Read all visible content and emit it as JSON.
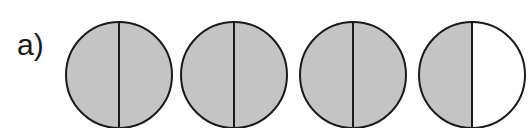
{
  "label": "a)",
  "colors": {
    "shaded": "#c4c4c4",
    "unshaded": "#ffffff",
    "stroke": "#1a1a1a"
  },
  "circles": [
    {
      "cx": 119,
      "left_shaded": true,
      "right_shaded": true
    },
    {
      "cx": 234,
      "left_shaded": true,
      "right_shaded": true
    },
    {
      "cx": 353,
      "left_shaded": true,
      "right_shaded": true
    },
    {
      "cx": 472,
      "left_shaded": true,
      "right_shaded": false
    }
  ],
  "geometry": {
    "cy": 75,
    "r": 53
  }
}
